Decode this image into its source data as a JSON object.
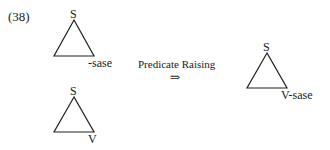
{
  "example_number": "(38)",
  "trees": [
    {
      "root": "S",
      "leaf": "-sase"
    },
    {
      "root": "S",
      "leaf": "V"
    },
    {
      "root": "S",
      "leaf": "V-sase"
    }
  ],
  "operation": {
    "label": "Predicate Raising",
    "arrow": "⇒"
  }
}
